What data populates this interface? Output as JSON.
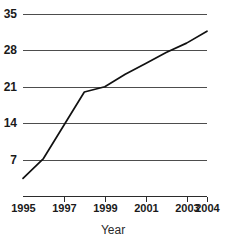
{
  "chart_data": {
    "type": "line",
    "title": "",
    "subtitle": "",
    "xlabel": "Year",
    "ylabel": "",
    "xlim": [
      1995,
      2004
    ],
    "ylim": [
      0,
      35
    ],
    "grid": "horizontal",
    "legend": "none",
    "x_tick_labels": [
      "1995",
      "1997",
      "1999",
      "2001",
      "2003",
      "2004"
    ],
    "x_tick_values": [
      1995,
      1997,
      1999,
      2001,
      2003,
      2004
    ],
    "y_tick_labels": [
      "7",
      "14",
      "21",
      "28",
      "35"
    ],
    "y_tick_values": [
      7,
      14,
      21,
      28,
      35
    ],
    "series": [
      {
        "name": "value",
        "x": [
          1995,
          1996,
          1997,
          1998,
          1999,
          2000,
          2001,
          2002,
          2003,
          2004
        ],
        "values": [
          3.4,
          7.2,
          13.6,
          20.0,
          21.0,
          23.4,
          25.5,
          27.6,
          29.4,
          31.7
        ]
      }
    ]
  },
  "axis": {
    "x_title": "Year"
  }
}
